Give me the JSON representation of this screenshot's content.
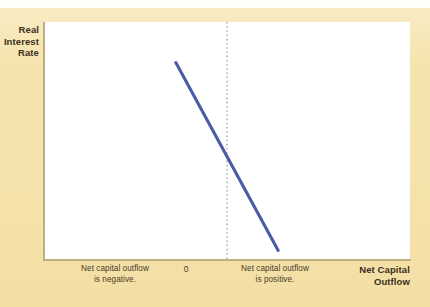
{
  "figure": {
    "background_color": "#f7e7b4",
    "plot_background_color": "#ffffff",
    "axis_color": "#bcae7e",
    "curve_color": "#4a5ba8",
    "zero_line_color": "#a9a9a9",
    "text_color": "#3b2f20"
  },
  "chart_data": {
    "type": "line",
    "title": "",
    "subtitle": "",
    "xlabel": "Net Capital Outflow",
    "ylabel": "Real Interest Rate",
    "grid": false,
    "legend": "none",
    "xlim": [
      -1,
      1
    ],
    "ylim": [
      0,
      1
    ],
    "axis_tick_labels": {
      "x": [
        "0"
      ],
      "y": []
    },
    "series": [
      {
        "name": "Net capital outflow curve",
        "color": "#4a5ba8",
        "points": [
          {
            "x": -0.28,
            "y": 0.83
          },
          {
            "x": 0.0,
            "y": 0.4
          },
          {
            "x": 0.28,
            "y": 0.04
          }
        ]
      }
    ],
    "reference_lines": [
      {
        "name": "zero",
        "orientation": "vertical",
        "x": 0,
        "style": "dotted",
        "label": "0"
      }
    ],
    "annotations": [
      {
        "name": "negative-region-caption",
        "lines": [
          "Net capital outflow",
          "is negative."
        ],
        "position": "below-axis-left"
      },
      {
        "name": "positive-region-caption",
        "lines": [
          "Net capital outflow",
          "is positive."
        ],
        "position": "below-axis-right"
      }
    ]
  },
  "labels": {
    "y_axis_title_lines": [
      "Real",
      "Interest",
      "Rate"
    ],
    "x_axis_title_lines": [
      "Net Capital",
      "Outflow"
    ],
    "zero_tick": "0",
    "caption_negative_lines": [
      "Net capital outflow",
      "is negative."
    ],
    "caption_positive_lines": [
      "Net capital outflow",
      "is positive."
    ]
  }
}
